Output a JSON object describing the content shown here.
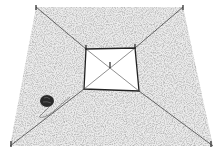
{
  "illustration": {
    "subject": "staked plot layout with string lines and ball of twine",
    "ground_color": "#d0d0d0",
    "line_color": "#333333",
    "center_fill": "#ffffff"
  },
  "caption": {
    "text": ""
  }
}
